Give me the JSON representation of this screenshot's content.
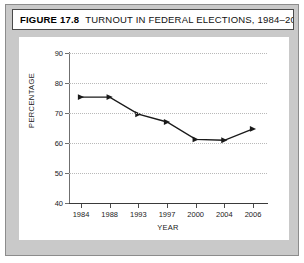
{
  "figure": {
    "label": "FIGURE 17.8",
    "title": "TURNOUT IN FEDERAL ELECTIONS, 1984–2006"
  },
  "chart_data": {
    "type": "line",
    "title": "TURNOUT IN FEDERAL ELECTIONS, 1984–2006",
    "xlabel": "YEAR",
    "ylabel": "PERCENTAGE",
    "categories": [
      "1984",
      "1988",
      "1993",
      "1997",
      "2000",
      "2004",
      "2006"
    ],
    "values": [
      75.3,
      75.3,
      69.6,
      67.0,
      61.2,
      60.9,
      64.7
    ],
    "ylim": [
      40,
      90
    ],
    "yticks": [
      40,
      50,
      60,
      70,
      80,
      90
    ],
    "ytick_labels": [
      "40",
      "50",
      "60",
      "70",
      "80",
      "90"
    ],
    "grid": "horizontal-dotted",
    "legend": "none",
    "marker": "triangle",
    "line_color": "#1a1a1a"
  },
  "colors": {
    "plate": "#c9c9c9",
    "card": "#ffffff",
    "axis": "#4a4a4a",
    "grid": "#b9b9b9",
    "series": "#1a1a1a"
  }
}
